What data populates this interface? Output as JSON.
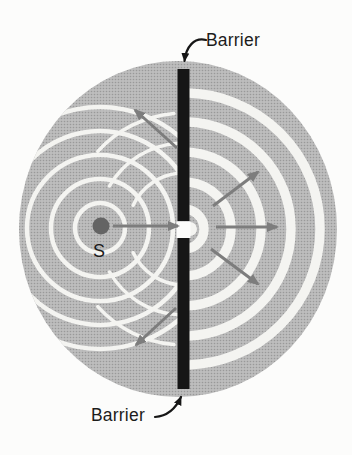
{
  "labels": {
    "barrier_top": "Barrier",
    "barrier_bottom": "Barrier",
    "source": "S"
  },
  "diagram": {
    "canvas": {
      "w": 352,
      "h": 455
    },
    "colors": {
      "background": "#fcfcfb",
      "halftone_base": "#bdbdbd",
      "halftone_dot": "#999999",
      "wavefront": "#f4f4f1",
      "barrier": "#161616",
      "ray": "#7d7d7d",
      "source_dot": "#646464",
      "text": "#1c1c1c"
    },
    "wave_region": {
      "cx": 178,
      "cy": 229,
      "rx": 159,
      "ry": 168
    },
    "left_wavefronts": {
      "cx": 100,
      "cy": 228,
      "radii": [
        25,
        49,
        73,
        97,
        121
      ],
      "stroke_width": 4.5
    },
    "right_wavefronts": {
      "cx": 184,
      "cy": 229,
      "radii": [
        20,
        47,
        77,
        107,
        136
      ],
      "stroke_width": 9.5,
      "mouth_disc": {
        "cx": 190,
        "cy": 229,
        "r": 7
      }
    },
    "reflected_wavefronts": {
      "stroke_width": 3.5,
      "paths": [
        "M181.1 173.1 A56 56 0 0 0 133.2 205.3",
        "M178.0 143.2 A86 86 0 0 0 109.5 186.0",
        "M173.9 113.4 A116 116 0 0 0 97.8 151.4",
        "M181.1 284.9 A56 56 0 0 1 133.2 252.7",
        "M178.0 314.8 A86 86 0 0 1 109.5 272.0",
        "M173.9 344.6 A116 116 0 0 1 97.8 306.6"
      ]
    },
    "barrier": {
      "x": 177.5,
      "width": 12,
      "top_segment": {
        "y1": 69,
        "y2": 221
      },
      "bottom_segment": {
        "y1": 238,
        "y2": 389
      },
      "slit_gap": {
        "x": 176.5,
        "y": 221.5,
        "w": 14,
        "h": 16.5
      }
    },
    "source_dot": {
      "cx": 101,
      "cy": 226,
      "r": 8.5
    },
    "rays": [
      {
        "name": "ray-source-to-slit",
        "x1": 113,
        "y1": 226,
        "x2": 178,
        "y2": 226
      },
      {
        "name": "ray-diffracted-up-left",
        "x1": 177,
        "y1": 148,
        "x2": 135,
        "y2": 110
      },
      {
        "name": "ray-diffracted-down-left",
        "x1": 176,
        "y1": 308,
        "x2": 136,
        "y2": 345
      },
      {
        "name": "ray-diffracted-up-right",
        "x1": 213,
        "y1": 206,
        "x2": 258,
        "y2": 172
      },
      {
        "name": "ray-diffracted-right",
        "x1": 216,
        "y1": 227,
        "x2": 277,
        "y2": 227
      },
      {
        "name": "ray-diffracted-down-right",
        "x1": 211,
        "y1": 249,
        "x2": 258,
        "y2": 284
      }
    ],
    "pointers": [
      {
        "name": "pointer-barrier-top",
        "d": "M206 40 C194 37 186 47 184.5 61"
      },
      {
        "name": "pointer-barrier-bottom",
        "d": "M155 417 C168 416 176 408 181 397"
      }
    ]
  }
}
